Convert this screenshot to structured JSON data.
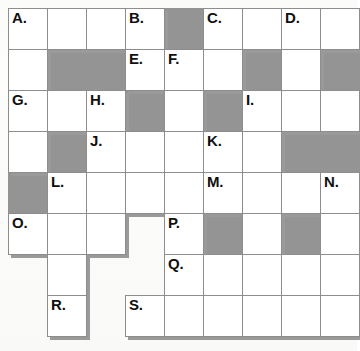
{
  "puzzle": {
    "title": "Crossword Grid",
    "columns": 9,
    "rows": 8,
    "cell_width": 39,
    "cell_height": 41,
    "origin_x": 8,
    "origin_y": 8,
    "colors": {
      "white_cell": "#ffffff",
      "blocked_cell": "#949494",
      "cell_border": "#8d8d8d",
      "shadow": "#9a9a9a",
      "clue_text": "#101010",
      "page_background": "#fdfdfc"
    },
    "clue_labels": [
      "A.",
      "B.",
      "C.",
      "D.",
      "E.",
      "F.",
      "G.",
      "H.",
      "I.",
      "J.",
      "K.",
      "L.",
      "M.",
      "N.",
      "O.",
      "P.",
      "Q.",
      "R.",
      "S."
    ],
    "grid": [
      [
        {
          "type": "white",
          "clue": "A."
        },
        {
          "type": "white",
          "clue": ""
        },
        {
          "type": "white",
          "clue": ""
        },
        {
          "type": "white",
          "clue": "B."
        },
        {
          "type": "block",
          "clue": ""
        },
        {
          "type": "white",
          "clue": "C."
        },
        {
          "type": "white",
          "clue": ""
        },
        {
          "type": "white",
          "clue": "D."
        },
        {
          "type": "white",
          "clue": ""
        }
      ],
      [
        {
          "type": "white",
          "clue": ""
        },
        {
          "type": "block",
          "clue": ""
        },
        {
          "type": "block",
          "clue": ""
        },
        {
          "type": "white",
          "clue": "E."
        },
        {
          "type": "white",
          "clue": "F."
        },
        {
          "type": "white",
          "clue": ""
        },
        {
          "type": "block",
          "clue": ""
        },
        {
          "type": "white",
          "clue": ""
        },
        {
          "type": "block",
          "clue": ""
        }
      ],
      [
        {
          "type": "white",
          "clue": "G."
        },
        {
          "type": "white",
          "clue": ""
        },
        {
          "type": "white",
          "clue": "H."
        },
        {
          "type": "block",
          "clue": ""
        },
        {
          "type": "white",
          "clue": ""
        },
        {
          "type": "block",
          "clue": ""
        },
        {
          "type": "white",
          "clue": "I."
        },
        {
          "type": "white",
          "clue": ""
        },
        {
          "type": "white",
          "clue": ""
        }
      ],
      [
        {
          "type": "white",
          "clue": ""
        },
        {
          "type": "block",
          "clue": ""
        },
        {
          "type": "white",
          "clue": "J."
        },
        {
          "type": "white",
          "clue": ""
        },
        {
          "type": "white",
          "clue": ""
        },
        {
          "type": "white",
          "clue": "K."
        },
        {
          "type": "white",
          "clue": ""
        },
        {
          "type": "block",
          "clue": ""
        },
        {
          "type": "block",
          "clue": ""
        }
      ],
      [
        {
          "type": "block",
          "clue": ""
        },
        {
          "type": "white",
          "clue": "L."
        },
        {
          "type": "white",
          "clue": ""
        },
        {
          "type": "white",
          "clue": ""
        },
        {
          "type": "white",
          "clue": ""
        },
        {
          "type": "white",
          "clue": "M."
        },
        {
          "type": "white",
          "clue": ""
        },
        {
          "type": "white",
          "clue": ""
        },
        {
          "type": "white",
          "clue": "N."
        }
      ],
      [
        {
          "type": "white",
          "clue": "O."
        },
        {
          "type": "white",
          "clue": ""
        },
        {
          "type": "white",
          "clue": ""
        },
        {
          "type": "void",
          "clue": ""
        },
        {
          "type": "white",
          "clue": "P."
        },
        {
          "type": "block",
          "clue": ""
        },
        {
          "type": "white",
          "clue": ""
        },
        {
          "type": "block",
          "clue": ""
        },
        {
          "type": "white",
          "clue": ""
        }
      ],
      [
        {
          "type": "void",
          "clue": ""
        },
        {
          "type": "white",
          "clue": ""
        },
        {
          "type": "void",
          "clue": ""
        },
        {
          "type": "void",
          "clue": ""
        },
        {
          "type": "white",
          "clue": "Q."
        },
        {
          "type": "white",
          "clue": ""
        },
        {
          "type": "white",
          "clue": ""
        },
        {
          "type": "white",
          "clue": ""
        },
        {
          "type": "white",
          "clue": ""
        }
      ],
      [
        {
          "type": "void",
          "clue": ""
        },
        {
          "type": "white",
          "clue": "R."
        },
        {
          "type": "void",
          "clue": ""
        },
        {
          "type": "white",
          "clue": "S."
        },
        {
          "type": "white",
          "clue": ""
        },
        {
          "type": "white",
          "clue": ""
        },
        {
          "type": "white",
          "clue": ""
        },
        {
          "type": "white",
          "clue": ""
        },
        {
          "type": "white",
          "clue": ""
        }
      ]
    ]
  }
}
